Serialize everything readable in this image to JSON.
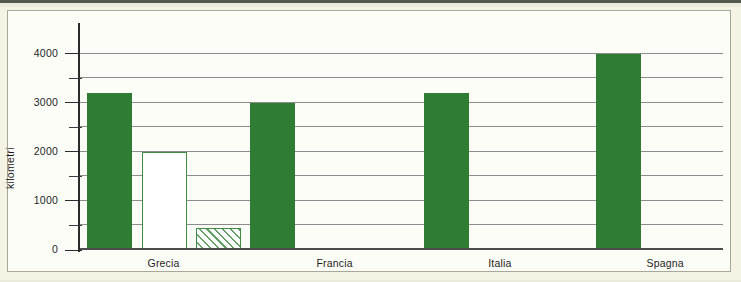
{
  "figure": {
    "background_color": "#f5f3e4",
    "panel_color": "#fdfdf8",
    "frame_color": "#a9a79a"
  },
  "chart_data": {
    "type": "bar",
    "title": "",
    "subtitle": "",
    "xlabel": "",
    "ylabel": "kilometri",
    "ylim": [
      0,
      4400
    ],
    "ytick_labels": [
      "0",
      "1000",
      "2000",
      "3000",
      "4000"
    ],
    "ytick_values": [
      0,
      1000,
      2000,
      3000,
      4000
    ],
    "minor_tick_values": [
      500,
      1500,
      2500,
      3500
    ],
    "gridline_values": [
      500,
      1000,
      1500,
      2000,
      2500,
      3000,
      3500,
      4000
    ],
    "grid": true,
    "legend": "none",
    "legend_position": "none",
    "categories": [
      "Grecia",
      "Francia",
      "Italia",
      "Spagna"
    ],
    "series": [
      {
        "name": "serie-1",
        "style": "solid",
        "color": "#2f7d32",
        "values": [
          3200,
          3000,
          3200,
          4000
        ]
      },
      {
        "name": "serie-2",
        "style": "outline",
        "color": "#3f8c44",
        "values": [
          2000,
          null,
          null,
          null
        ]
      },
      {
        "name": "serie-3",
        "style": "hatched",
        "color": "#63a166",
        "values": [
          450,
          null,
          null,
          null
        ]
      }
    ],
    "bars": [
      {
        "category": "Grecia",
        "series": "serie-1",
        "value": 3200,
        "style": "solid",
        "left_pct": 1.1,
        "width_pct": 7.0
      },
      {
        "category": "Grecia",
        "series": "serie-2",
        "value": 2000,
        "style": "outline",
        "left_pct": 9.6,
        "width_pct": 7.0
      },
      {
        "category": "Grecia",
        "series": "serie-3",
        "value": 450,
        "style": "hatched",
        "left_pct": 18.0,
        "width_pct": 7.0
      },
      {
        "category": "Francia",
        "series": "serie-1",
        "value": 3000,
        "style": "solid",
        "left_pct": 26.5,
        "width_pct": 7.0
      },
      {
        "category": "Italia",
        "series": "serie-1",
        "value": 3200,
        "style": "solid",
        "left_pct": 53.5,
        "width_pct": 7.0
      },
      {
        "category": "Spagna",
        "series": "serie-1",
        "value": 4000,
        "style": "solid",
        "left_pct": 80.3,
        "width_pct": 7.0
      }
    ],
    "category_label_x_pct": [
      13.0,
      39.6,
      65.3,
      91.0
    ]
  }
}
